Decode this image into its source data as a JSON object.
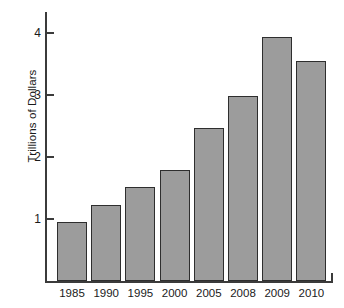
{
  "chart_data": {
    "type": "bar",
    "title": "",
    "subtitle": "",
    "xlabel": "",
    "ylabel": "Trillions of Dollars",
    "categories": [
      "1985",
      "1990",
      "1995",
      "2000",
      "2005",
      "2008",
      "2009",
      "2010"
    ],
    "values": [
      0.95,
      1.22,
      1.52,
      1.79,
      2.46,
      2.98,
      3.94,
      3.55
    ],
    "series": [
      {
        "name": "Trillions of Dollars",
        "values": [
          0.95,
          1.22,
          1.52,
          1.79,
          2.46,
          2.98,
          3.94,
          3.55
        ]
      }
    ],
    "ylim": [
      0,
      4.35
    ],
    "yticks": [
      1,
      2,
      3,
      4
    ],
    "ytick_labels": [
      "1",
      "2",
      "3",
      "4"
    ],
    "grid": false,
    "legend": false,
    "legend_position": "none",
    "bar_color": "#9c9c9c",
    "bar_edge_color": "#2e2e2e",
    "axis_color": "#3b3b3b",
    "background_color": "#ffffff"
  }
}
